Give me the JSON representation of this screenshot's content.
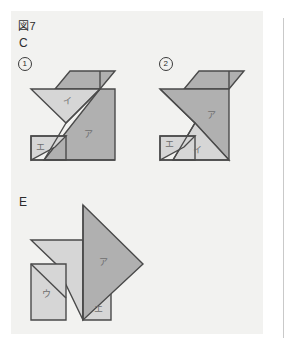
{
  "page": {
    "figure_number_label": "図7",
    "section_c_label": "C",
    "section_e_label": "E",
    "item1_number": "1",
    "item2_number": "2"
  },
  "colors": {
    "page_background": "#ffffff",
    "panel_background": "#f2f2f0",
    "dark_piece_fill": "#b0b0b0",
    "light_piece_fill": "#d6d6d6",
    "stroke": "#4a4a4a",
    "label_text": "#2b2b2b",
    "piece_label_text": "#6e6e6e",
    "rule_line": "#c9c9c9"
  },
  "figures": [
    {
      "id": "figure-c-1",
      "caption": "1",
      "pieces": [
        {
          "name": "piece-a",
          "label": "ア",
          "shade": "dark",
          "label_x": 84,
          "label_y": 137
        },
        {
          "name": "piece-i",
          "label": "イ",
          "shade": "light",
          "label_x": 63,
          "label_y": 104
        },
        {
          "name": "piece-e",
          "label": "エ",
          "shade": "light",
          "label_x": 36,
          "label_y": 150
        }
      ]
    },
    {
      "id": "figure-c-2",
      "caption": "2",
      "pieces": [
        {
          "name": "piece-a",
          "label": "ア",
          "shade": "dark",
          "label_x": 212,
          "label_y": 117
        },
        {
          "name": "piece-i",
          "label": "イ",
          "shade": "light",
          "label_x": 197,
          "label_y": 152
        },
        {
          "name": "piece-e",
          "label": "エ",
          "shade": "light",
          "label_x": 168,
          "label_y": 147
        }
      ]
    },
    {
      "id": "figure-e",
      "caption": "E",
      "pieces": [
        {
          "name": "piece-a",
          "label": "ア",
          "shade": "dark",
          "label_x": 102,
          "label_y": 264
        },
        {
          "name": "piece-u",
          "label": "ウ",
          "shade": "light",
          "label_x": 46,
          "label_y": 294
        },
        {
          "name": "piece-e",
          "label": "エ",
          "shade": "light",
          "label_x": 99,
          "label_y": 310
        }
      ]
    }
  ],
  "geometry": {
    "figure1": {
      "dark_parallelogram": "70,71 115,71 100,89 55,89",
      "light_triangle": "31,89 100,89 66,123",
      "notch_triangle": "66,123 100,89 100,123",
      "dark_big_triangle": "100,89 115,89 115,160 44,160",
      "light_square": "31,136 66,136 66,160 31,160",
      "outline_right": "115,71 115,160",
      "edge_paths": [
        "31,89 100,89",
        "31,89 66,123",
        "66,123 44,160",
        "44,160 115,160",
        "115,160 115,71",
        "115,71 70,71",
        "70,71 55,89",
        "100,89 100,71",
        "31,136 66,136",
        "31,136 31,160",
        "66,123 100,89"
      ]
    },
    "figure2": {
      "dark_parallelogram": "199,71 244,71 229,89 184,89",
      "dark_big_triangle": "160,89 229,89 195,123",
      "light_triangle": "195,123 229,160 160,160",
      "light_square": "160,136 195,136 195,160 160,160"
    },
    "figureE": {
      "dark_triangle": "83,205 143,264 83,320",
      "light_arrow": "31,240 83,240 83,290 56,264",
      "light_square": "31,264 66,264 66,320 31,320",
      "light_small_tri": "83,290 111,290 111,320 83,320"
    }
  }
}
